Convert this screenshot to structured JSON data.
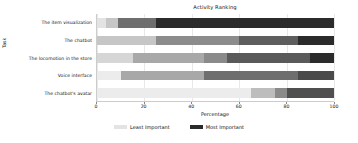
{
  "chart_data": {
    "type": "bar",
    "orientation": "horizontal",
    "stacked": true,
    "normalized_percent": true,
    "title": "Activity Ranking",
    "xlabel": "Percentage",
    "ylabel": "Task",
    "xlim": [
      0,
      100
    ],
    "xticks": [
      0,
      20,
      40,
      60,
      80,
      100
    ],
    "xtick_labels": [
      "0",
      "20",
      "40",
      "60",
      "80",
      "100"
    ],
    "grid": true,
    "grid_axis": "x",
    "legend_position": "bottom-center",
    "legend": [
      {
        "label": "Least Important",
        "color": "#e3e3e3"
      },
      {
        "label": "Most Important",
        "color": "#2b2b2b"
      }
    ],
    "categories": [
      "The item visualization",
      "The chatbot",
      "The locomotion in the store",
      "Voice interface",
      "The chatbot's avatar"
    ],
    "series": [
      {
        "name": "Least Important",
        "color": "#e3e3e3",
        "values": [
          4,
          25,
          15,
          10,
          65
        ]
      },
      {
        "name": "Rank 2",
        "color": "#c6c6c6",
        "values": [
          5,
          0,
          0,
          0,
          10
        ]
      },
      {
        "name": "Rank 3",
        "color": "#a0a0a0",
        "values": [
          16,
          35,
          30,
          35,
          0
        ]
      },
      {
        "name": "Rank 4",
        "color": "#6e6e6e",
        "values": [
          0,
          25,
          10,
          0,
          5
        ]
      },
      {
        "name": "Rank 5",
        "color": "#4a4a4a",
        "values": [
          0,
          0,
          35,
          40,
          0
        ]
      },
      {
        "name": "Most Important",
        "color": "#2b2b2b",
        "values": [
          75,
          15,
          10,
          15,
          20
        ]
      }
    ],
    "bars": [
      {
        "category": "The item visualization",
        "segments": [
          {
            "series": "Least Important",
            "value": 4,
            "color": "#e3e3e3"
          },
          {
            "series": "Rank 2",
            "value": 5,
            "color": "#c6c6c6"
          },
          {
            "series": "Rank 3",
            "value": 16,
            "color": "#6e6e6e"
          },
          {
            "series": "Most Important",
            "value": 75,
            "color": "#2b2b2b"
          }
        ]
      },
      {
        "category": "The chatbot",
        "segments": [
          {
            "series": "Least Important",
            "value": 25,
            "color": "#c6c6c6"
          },
          {
            "series": "Rank 3",
            "value": 35,
            "color": "#8c8c8c"
          },
          {
            "series": "Rank 4",
            "value": 25,
            "color": "#5e5e5e"
          },
          {
            "series": "Most Important",
            "value": 15,
            "color": "#2b2b2b"
          }
        ]
      },
      {
        "category": "The locomotion in the store",
        "segments": [
          {
            "series": "Least Important",
            "value": 15,
            "color": "#d6d6d6"
          },
          {
            "series": "Rank 3",
            "value": 30,
            "color": "#a8a8a8"
          },
          {
            "series": "Rank 4",
            "value": 10,
            "color": "#8a8a8a"
          },
          {
            "series": "Rank 5",
            "value": 35,
            "color": "#5a5a5a"
          },
          {
            "series": "Most Important",
            "value": 10,
            "color": "#2b2b2b"
          }
        ]
      },
      {
        "category": "Voice interface",
        "segments": [
          {
            "series": "Least Important",
            "value": 10,
            "color": "#ececec"
          },
          {
            "series": "Rank 3",
            "value": 35,
            "color": "#a8a8a8"
          },
          {
            "series": "Rank 5",
            "value": 40,
            "color": "#6e6e6e"
          },
          {
            "series": "Most Important",
            "value": 15,
            "color": "#4a4a4a"
          }
        ]
      },
      {
        "category": "The chatbot's avatar",
        "segments": [
          {
            "series": "Least Important",
            "value": 65,
            "color": "#ececec"
          },
          {
            "series": "Rank 2",
            "value": 10,
            "color": "#bdbdbd"
          },
          {
            "series": "Rank 4",
            "value": 5,
            "color": "#8a8a8a"
          },
          {
            "series": "Most Important",
            "value": 20,
            "color": "#4f4f4f"
          }
        ]
      }
    ]
  }
}
